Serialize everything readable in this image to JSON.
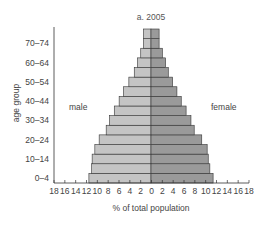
{
  "chart_data": {
    "type": "bar",
    "subtype": "population-pyramid",
    "title": "a. 2005",
    "xlabel": "% of total population",
    "ylabel": "age group",
    "xlim": [
      -18,
      18
    ],
    "x_ticks": [
      18,
      16,
      14,
      12,
      10,
      8,
      6,
      4,
      2,
      0,
      2,
      4,
      6,
      8,
      10,
      12,
      14,
      16,
      18
    ],
    "y_tick_labels": [
      "0–4",
      "10–14",
      "20–24",
      "30–34",
      "40–44",
      "50–54",
      "60–64",
      "70–74"
    ],
    "categories": [
      "0–4",
      "5–9",
      "10–14",
      "15–19",
      "20–24",
      "25–29",
      "30–34",
      "35–39",
      "40–44",
      "45–49",
      "50–54",
      "55–59",
      "60–64",
      "65–69",
      "70–74",
      "75+"
    ],
    "series": [
      {
        "name": "male",
        "color": "#c4c4c4",
        "values": [
          11.5,
          11.0,
          10.9,
          10.4,
          9.6,
          8.3,
          7.7,
          6.8,
          5.9,
          5.1,
          4.1,
          3.1,
          2.5,
          1.9,
          1.4,
          1.4
        ]
      },
      {
        "name": "female",
        "color": "#9a9a9a",
        "values": [
          11.5,
          10.9,
          10.6,
          10.4,
          9.4,
          8.0,
          7.4,
          6.5,
          5.6,
          4.8,
          4.0,
          3.2,
          2.7,
          2.1,
          1.5,
          1.5
        ]
      }
    ],
    "annotations": [
      "male",
      "female"
    ],
    "grid": false,
    "legend": "none"
  },
  "labels": {
    "title": "a. 2005",
    "male": "male",
    "female": "female",
    "xlabel": "% of total population",
    "ylabel": "age group"
  }
}
